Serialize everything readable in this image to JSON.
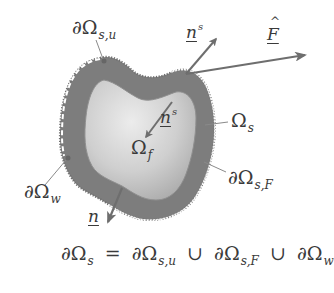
{
  "figure": {
    "type": "fluid-structure interaction domain schematic",
    "colors": {
      "background": "#ffffff",
      "solid_domain": "#7d7d7d",
      "fluid_domain_light": "#e8e8e8",
      "fluid_domain_dark": "#a9a9a9",
      "arrows": "#6e6e6e",
      "leader_lines": "#8a8a8a",
      "text": "#3a3a3a",
      "dashed_boundary": "#ffffff"
    },
    "labels": {
      "boundary_su": {
        "main": "∂Ω",
        "sub": "s,u"
      },
      "outer_normal": {
        "main": "n",
        "sup": "s"
      },
      "force": {
        "main": "F"
      },
      "inner_normal": {
        "main": "n",
        "sup": "s"
      },
      "solid_domain": {
        "main": "Ω",
        "sub": "s"
      },
      "fluid_domain": {
        "main": "Ω",
        "sub": "f"
      },
      "boundary_w": {
        "main": "∂Ω",
        "sub": "w"
      },
      "boundary_sF": {
        "main": "∂Ω",
        "sub": "s,F"
      },
      "normal": {
        "main": "n"
      }
    },
    "equation": {
      "lhs": {
        "main": "∂Ω",
        "sub": "s"
      },
      "equals": "=",
      "union": "∪",
      "terms": [
        {
          "main": "∂Ω",
          "sub": "s,u"
        },
        {
          "main": "∂Ω",
          "sub": "s,F"
        },
        {
          "main": "∂Ω",
          "sub": "w"
        }
      ]
    }
  }
}
